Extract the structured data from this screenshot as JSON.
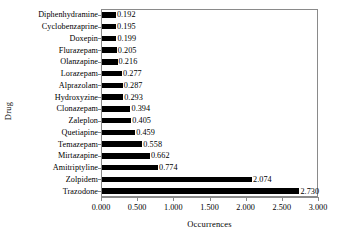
{
  "chart_data": {
    "type": "bar",
    "orientation": "horizontal",
    "title": "",
    "xlabel": "Occurrences",
    "ylabel": "Drug",
    "xlim": [
      0.0,
      3.0
    ],
    "xticks": [
      "0.000",
      "0.500",
      "1.000",
      "1.500",
      "2.000",
      "2.500",
      "3.000"
    ],
    "xtick_values": [
      0.0,
      0.5,
      1.0,
      1.5,
      2.0,
      2.5,
      3.0
    ],
    "grid": false,
    "legend": null,
    "bar_color": "#000000",
    "frame_color": "#8a8a8a",
    "background": "#ffffff",
    "categories": [
      "Diphenhydramine",
      "Cyclobenzaprine",
      "Doxepin",
      "Flurazepam",
      "Olanzapine",
      "Lorazepam",
      "Alprazolam",
      "Hydroxyzine",
      "Clonazepam",
      "Zaleplon",
      "Quetiapine",
      "Temazepam",
      "Mirtazapine",
      "Amitriptyline",
      "Zolpidem",
      "Trazodone"
    ],
    "values": [
      0.192,
      0.195,
      0.199,
      0.205,
      0.216,
      0.277,
      0.287,
      0.293,
      0.394,
      0.405,
      0.459,
      0.558,
      0.662,
      0.774,
      2.074,
      2.73
    ],
    "data_labels": [
      "0.192",
      "0.195",
      "0.199",
      "0.205",
      "0.216",
      "0.277",
      "0.287",
      "0.293",
      "0.394",
      "0.405",
      "0.459",
      "0.558",
      "0.662",
      "0.774",
      "2.074",
      "2.730"
    ]
  }
}
